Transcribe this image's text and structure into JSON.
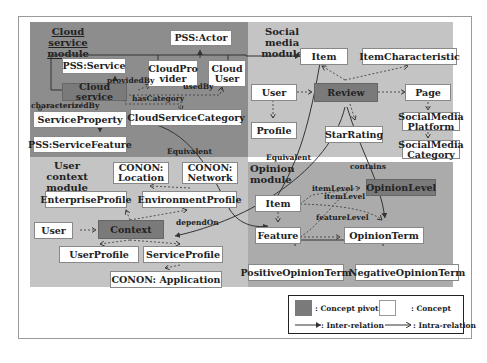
{
  "modules": {
    "cloud": "Cloud service module",
    "social": "Social media module",
    "user_context": "User context module",
    "opinion": "Opinion module"
  },
  "concepts": {
    "pss_actor": "PSS:Actor",
    "pss_service": "PSS:Service",
    "cloud_provider": "CloudPro vider",
    "cloud_user": "Cloud User",
    "cloud_service": "Cloud service",
    "service_property": "ServiceProperty",
    "cloud_service_category": "CloudServiceCategory",
    "pss_service_feature": "PSS:ServiceFeature",
    "sm_item": "Item",
    "item_characteristic": "ItemCharacteristic",
    "sm_user": "User",
    "review": "Review",
    "page": "Page",
    "profile": "Profile",
    "star_rating": "StarRating",
    "social_media_platform": "SocialMedia Platform",
    "social_media_category": "SocialMedia Category",
    "conon_location": "CONON: Location",
    "conon_network": "CONON: Network",
    "enterprise_profile": "EnterpriseProfile",
    "environment_profile": "EnvironmentProfile",
    "uc_user": "User",
    "context": "Context",
    "user_profile": "UserProfile",
    "service_profile": "ServiceProfile",
    "conon_application": "CONON: Application",
    "op_item": "Item",
    "feature": "Feature",
    "opinion_level": "OpinionLevel",
    "opinion_term": "OpinionTerm",
    "positive_opinion_term": "PositiveOpinionTerm",
    "negative_opinion_term": "NegativeOpinionTerm"
  },
  "relations": {
    "provided_by": "providedBy",
    "used_by": "usedBy",
    "has_category": "hasCategory",
    "characterized_by": "characterizedBy",
    "equivalent_1": "Equivalent",
    "equivalent_2": "Equivalent",
    "contains": "contains",
    "depend_on": "dependOn",
    "item_level_1": "itemLevel",
    "item_level_2": "itemLevel",
    "feature_level": "featureLevel"
  },
  "legend": {
    "concept_pivot": ": Concept pivot",
    "concept": ": Concept",
    "inter_relation": ": Inter-relation",
    "intra_relation": ": Intra-relation"
  },
  "colors": {
    "cloud_module": "#8d8d8d",
    "social_module": "#c4c4c4",
    "user_context_module": "#c4c4c4",
    "opinion_module": "#ababab",
    "pivot": "#7a7a7a",
    "concept": "#ffffff"
  }
}
